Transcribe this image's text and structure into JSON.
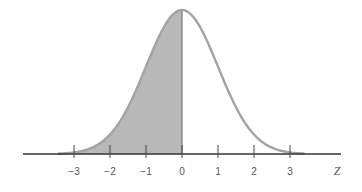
{
  "chart_data": {
    "type": "area",
    "title": "",
    "xlabel": "Z",
    "ylabel": "",
    "xlim": [
      -3.5,
      3.5
    ],
    "x_ticks": [
      -3,
      -2,
      -1,
      0,
      1,
      2,
      3
    ],
    "x_tick_labels": [
      "-3",
      "-2",
      "-1",
      "0",
      "1",
      "2",
      "3"
    ],
    "grid": false,
    "legend": null,
    "series": [
      {
        "name": "standard normal density",
        "mean": 0,
        "sd": 1,
        "x": [
          -3.5,
          -3,
          -2.5,
          -2,
          -1.5,
          -1,
          -0.5,
          0,
          0.5,
          1,
          1.5,
          2,
          2.5,
          3,
          3.5
        ],
        "values": [
          0.0009,
          0.0044,
          0.0175,
          0.054,
          0.1295,
          0.242,
          0.3521,
          0.3989,
          0.3521,
          0.242,
          0.1295,
          0.054,
          0.0175,
          0.0044,
          0.0009
        ]
      }
    ],
    "shaded_region": {
      "from": -3,
      "to": 0
    },
    "colors": {
      "curve": "#a0a0a0",
      "shade": "#b8b8b8",
      "axis": "#333333",
      "text": "#555555"
    }
  },
  "labels": {
    "ticks": [
      "−3",
      "−2",
      "−1",
      "0",
      "1",
      "2",
      "3"
    ],
    "axis_variable": "Z"
  }
}
